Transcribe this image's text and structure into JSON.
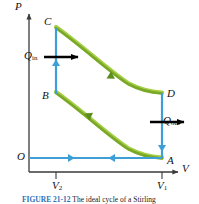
{
  "figure": {
    "kind": "pv-diagram",
    "axes": {
      "y_label": "P",
      "x_label": "V",
      "origin_label": "O",
      "x_ticks": [
        {
          "label": "V",
          "sub": "2",
          "x_px": 56
        },
        {
          "label": "V",
          "sub": "1",
          "x_px": 162
        }
      ]
    },
    "points": [
      {
        "name": "A",
        "label": "A",
        "x_px": 162,
        "y_px": 158
      },
      {
        "name": "B",
        "label": "B",
        "x_px": 56,
        "y_px": 93
      },
      {
        "name": "C",
        "label": "C",
        "x_px": 56,
        "y_px": 28
      },
      {
        "name": "D",
        "label": "D",
        "x_px": 162,
        "y_px": 93
      }
    ],
    "heat_arrows": [
      {
        "name": "Q_in",
        "label": "Q",
        "sub": "in",
        "direction": "right"
      },
      {
        "name": "Q_out",
        "label": "Q",
        "sub": "out",
        "direction": "right"
      }
    ],
    "colors": {
      "isotherm": "#7aa828",
      "isotherm_edge": "#9ac43a",
      "process": "#3d9fd6",
      "axis": "#3a3a3a",
      "arrow_black": "#000000",
      "caption_accent": "#2f6fb5"
    },
    "processes": [
      {
        "name": "B-to-C",
        "type": "isochoric",
        "color": "process",
        "arrow": "up"
      },
      {
        "name": "C-to-D",
        "type": "isothermal-expansion",
        "color": "isotherm",
        "arrow": "right-down"
      },
      {
        "name": "D-to-A",
        "type": "isochoric",
        "color": "process",
        "arrow": "down"
      },
      {
        "name": "A-to-B",
        "type": "isothermal-compression",
        "color": "isotherm",
        "arrow": "left-up"
      },
      {
        "name": "O-axis-right",
        "type": "baseline",
        "color": "process",
        "arrow": "right"
      },
      {
        "name": "A-axis-left",
        "type": "baseline",
        "color": "process",
        "arrow": "left"
      }
    ]
  },
  "caption": {
    "number": "FIGURE 21-12",
    "text": "The ideal cycle of a Stirling"
  }
}
